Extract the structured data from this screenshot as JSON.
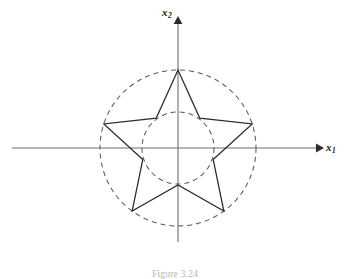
{
  "figure": {
    "caption": "Figure 3.24",
    "background_color": "#ffffff",
    "axis_color": "#6e6e6e",
    "curve_color": "#5a5a5a",
    "star_color": "#2b2b2b"
  },
  "axes": {
    "x_label_text": "x",
    "x_label_sub": "1",
    "y_label_text": "x",
    "y_label_sub": "2",
    "origin": {
      "x": 178,
      "y": 148
    },
    "x_axis_start": 12,
    "x_axis_end": 322,
    "y_axis_top": 18,
    "y_axis_bottom": 242,
    "arrowheads": [
      "x-positive",
      "y-positive"
    ]
  },
  "chart_data": {
    "type": "line",
    "title": "",
    "subtitle": "",
    "xlabel": "x1",
    "ylabel": "x2",
    "grid": false,
    "legend": null,
    "xlim": [
      -100,
      100
    ],
    "ylim": [
      -100,
      100
    ],
    "series": [
      {
        "name": "outer-dashed-circle",
        "shape": "circle",
        "style": "dashed",
        "center": [
          0,
          0
        ],
        "radius": 78,
        "dash_pattern": [
          5,
          4
        ]
      },
      {
        "name": "inner-dashed-circle",
        "shape": "circle",
        "style": "dashed",
        "center": [
          0,
          0
        ],
        "radius": 36,
        "dash_pattern": [
          5,
          4
        ]
      },
      {
        "name": "star-polygon",
        "shape": "polygon",
        "style": "solid",
        "points_count": 5,
        "outer_radius": 78,
        "inner_radius": 37,
        "start_angle_deg": 90,
        "vertices_outer": [
          [
            0,
            78
          ],
          [
            74.2,
            24.1
          ],
          [
            45.8,
            -63.1
          ],
          [
            -45.8,
            -63.1
          ],
          [
            -74.2,
            24.1
          ]
        ],
        "vertices_inner": [
          [
            21.8,
            29.9
          ],
          [
            35.2,
            -11.4
          ],
          [
            0,
            -37.0
          ],
          [
            -35.2,
            -11.4
          ],
          [
            -21.8,
            29.9
          ]
        ]
      }
    ]
  }
}
